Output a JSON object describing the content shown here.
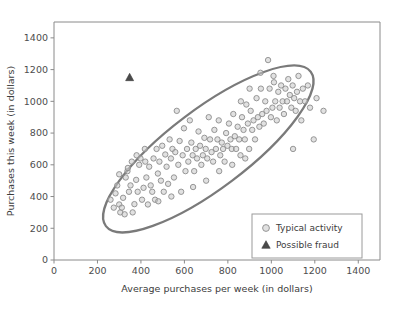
{
  "chart_data": {
    "type": "scatter",
    "title": "",
    "xlabel": "Average purchases per week (in dollars)",
    "ylabel": "Purchases this week (in dollars)",
    "xlim": [
      0,
      1500
    ],
    "ylim": [
      0,
      1500
    ],
    "xticks": [
      0,
      200,
      400,
      600,
      800,
      1000,
      1200,
      1400
    ],
    "yticks": [
      0,
      200,
      400,
      600,
      800,
      1000,
      1200,
      1400
    ],
    "xtick_labels": [
      "0",
      "200",
      "400",
      "600",
      "800",
      "1000",
      "1200",
      "1400"
    ],
    "ytick_labels": [
      "0",
      "200",
      "400",
      "600",
      "800",
      "1000",
      "1200",
      "1400"
    ],
    "grid": false,
    "legend_position": "lower right",
    "series": [
      {
        "name": "Typical activity",
        "marker": "circle",
        "color": "#c9c9c9",
        "edge_color": "#8c8c8c",
        "points": [
          [
            283,
            420
          ],
          [
            291,
            470
          ],
          [
            300,
            350
          ],
          [
            305,
            300
          ],
          [
            312,
            330
          ],
          [
            318,
            392
          ],
          [
            325,
            288
          ],
          [
            330,
            520
          ],
          [
            338,
            560
          ],
          [
            345,
            430
          ],
          [
            352,
            470
          ],
          [
            358,
            620
          ],
          [
            362,
            300
          ],
          [
            370,
            352
          ],
          [
            378,
            505
          ],
          [
            385,
            430
          ],
          [
            392,
            600
          ],
          [
            398,
            640
          ],
          [
            405,
            380
          ],
          [
            412,
            455
          ],
          [
            418,
            700
          ],
          [
            425,
            520
          ],
          [
            432,
            350
          ],
          [
            438,
            588
          ],
          [
            445,
            470
          ],
          [
            452,
            430
          ],
          [
            458,
            640
          ],
          [
            465,
            380
          ],
          [
            472,
            700
          ],
          [
            478,
            545
          ],
          [
            485,
            620
          ],
          [
            492,
            500
          ],
          [
            498,
            720
          ],
          [
            505,
            430
          ],
          [
            512,
            665
          ],
          [
            518,
            588
          ],
          [
            525,
            480
          ],
          [
            532,
            760
          ],
          [
            538,
            640
          ],
          [
            545,
            700
          ],
          [
            552,
            520
          ],
          [
            558,
            680
          ],
          [
            565,
            940
          ],
          [
            572,
            600
          ],
          [
            578,
            750
          ],
          [
            585,
            430
          ],
          [
            592,
            660
          ],
          [
            598,
            830
          ],
          [
            605,
            560
          ],
          [
            612,
            700
          ],
          [
            618,
            620
          ],
          [
            625,
            880
          ],
          [
            632,
            740
          ],
          [
            638,
            660
          ],
          [
            645,
            560
          ],
          [
            652,
            700
          ],
          [
            658,
            640
          ],
          [
            665,
            810
          ],
          [
            672,
            720
          ],
          [
            678,
            600
          ],
          [
            685,
            660
          ],
          [
            692,
            770
          ],
          [
            698,
            700
          ],
          [
            705,
            640
          ],
          [
            712,
            900
          ],
          [
            718,
            760
          ],
          [
            725,
            680
          ],
          [
            732,
            620
          ],
          [
            738,
            820
          ],
          [
            745,
            700
          ],
          [
            752,
            760
          ],
          [
            758,
            880
          ],
          [
            765,
            660
          ],
          [
            772,
            740
          ],
          [
            778,
            700
          ],
          [
            785,
            620
          ],
          [
            792,
            800
          ],
          [
            798,
            720
          ],
          [
            805,
            860
          ],
          [
            812,
            760
          ],
          [
            818,
            700
          ],
          [
            825,
            920
          ],
          [
            832,
            780
          ],
          [
            838,
            700
          ],
          [
            845,
            840
          ],
          [
            852,
            760
          ],
          [
            858,
            660
          ],
          [
            865,
            900
          ],
          [
            872,
            820
          ],
          [
            878,
            760
          ],
          [
            885,
            980
          ],
          [
            892,
            860
          ],
          [
            898,
            700
          ],
          [
            905,
            940
          ],
          [
            912,
            820
          ],
          [
            918,
            880
          ],
          [
            925,
            760
          ],
          [
            932,
            1020
          ],
          [
            938,
            900
          ],
          [
            945,
            840
          ],
          [
            952,
            1080
          ],
          [
            958,
            920
          ],
          [
            965,
            860
          ],
          [
            972,
            1000
          ],
          [
            978,
            940
          ],
          [
            985,
            1260
          ],
          [
            992,
            1080
          ],
          [
            998,
            900
          ],
          [
            1005,
            960
          ],
          [
            1012,
            1120
          ],
          [
            1018,
            1000
          ],
          [
            1025,
            880
          ],
          [
            1032,
            1060
          ],
          [
            1038,
            960
          ],
          [
            1045,
            1100
          ],
          [
            1052,
            1000
          ],
          [
            1058,
            920
          ],
          [
            1065,
            1080
          ],
          [
            1072,
            1000
          ],
          [
            1078,
            1140
          ],
          [
            1085,
            1040
          ],
          [
            1092,
            960
          ],
          [
            1098,
            1100
          ],
          [
            1105,
            1020
          ],
          [
            1112,
            940
          ],
          [
            1118,
            1060
          ],
          [
            1125,
            1160
          ],
          [
            1132,
            1000
          ],
          [
            1138,
            880
          ],
          [
            1145,
            1080
          ],
          [
            1155,
            1000
          ],
          [
            1168,
            1100
          ],
          [
            1178,
            960
          ],
          [
            1195,
            760
          ],
          [
            1208,
            1020
          ],
          [
            1100,
            700
          ],
          [
            1240,
            940
          ],
          [
            640,
            460
          ],
          [
            700,
            500
          ],
          [
            760,
            560
          ],
          [
            820,
            600
          ],
          [
            880,
            640
          ],
          [
            540,
            400
          ],
          [
            480,
            370
          ],
          [
            420,
            620
          ],
          [
            380,
            660
          ],
          [
            340,
            580
          ],
          [
            300,
            540
          ],
          [
            260,
            380
          ],
          [
            275,
            330
          ],
          [
            950,
            1180
          ],
          [
            1010,
            1160
          ],
          [
            900,
            1080
          ],
          [
            860,
            1000
          ]
        ]
      },
      {
        "name": "Possible fraud",
        "marker": "triangle",
        "color": "#4a4a4a",
        "points": [
          [
            348,
            1150
          ]
        ]
      }
    ],
    "annotations": [
      {
        "type": "ellipse",
        "label": "typical-activity-boundary",
        "center_x": 710,
        "center_y": 700,
        "width": 1180,
        "height": 500,
        "angle_deg": -37,
        "stroke": "#7a7a7a"
      }
    ],
    "legend": {
      "entries": [
        {
          "label": "Typical activity",
          "marker": "circle"
        },
        {
          "label": "Possible fraud",
          "marker": "triangle"
        }
      ]
    }
  }
}
